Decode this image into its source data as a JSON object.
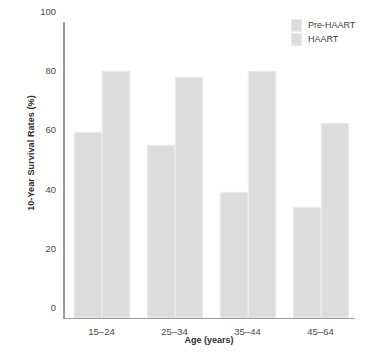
{
  "chart_data": {
    "type": "bar",
    "title": "",
    "xlabel": "Age (years)",
    "ylabel": "10-Year Survival Rates (%)",
    "categories": [
      "15–24",
      "25–34",
      "35–44",
      "45–64"
    ],
    "series": [
      {
        "name": "Pre-HAART",
        "values": [
          63,
          58.5,
          42.5,
          37.5
        ]
      },
      {
        "name": "HAART",
        "values": [
          83.5,
          81.5,
          83.5,
          66
        ]
      }
    ],
    "ylim": [
      0,
      100
    ],
    "yticks": [
      0,
      20,
      40,
      60,
      80,
      100
    ],
    "ytick_labels": [
      "0",
      "20",
      "40",
      "60",
      "80",
      "100"
    ],
    "grid": false,
    "legend_position": "top-right",
    "bar_color": "#dcdcdc",
    "axis_color": "#9b9b9b",
    "text_color": "#3a3a3a"
  },
  "legend": {
    "items": [
      {
        "label": "Pre-HAART"
      },
      {
        "label": "HAART"
      }
    ]
  }
}
